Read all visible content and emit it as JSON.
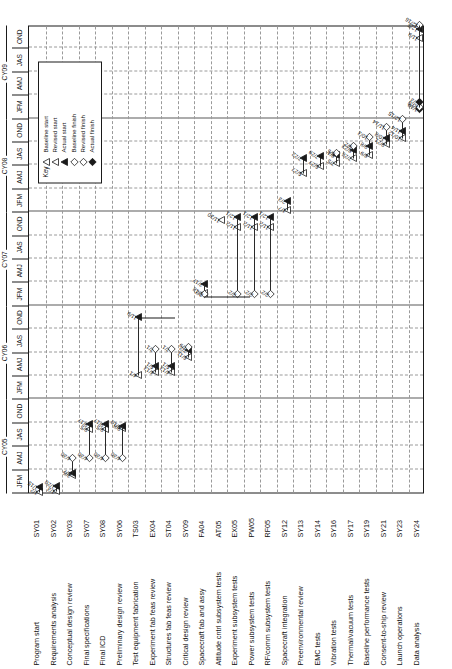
{
  "chart_data": {
    "type": "gantt",
    "orientation": "rotated-90",
    "fiscal_years": [
      "FY05",
      "FY06",
      "FY07",
      "FY08",
      "FY09",
      "FY10"
    ],
    "calendar_years": [
      "CY05",
      "CY06",
      "CY07",
      "CY08",
      "CY09"
    ],
    "quarters": [
      "JFM",
      "AMJ",
      "JAS",
      "OND"
    ],
    "quarter_sequence": [
      "JFM",
      "AMJ",
      "JAS",
      "OND",
      "JFM",
      "AMJ",
      "JAS",
      "OND",
      "JFM",
      "AMJ",
      "JAS",
      "OND",
      "JFM",
      "AMJ",
      "JAS",
      "OND",
      "JFM",
      "AMJ",
      "JAS",
      "OND"
    ],
    "xlabel": "",
    "ylabel": "",
    "grid": true,
    "tasks": [
      {
        "name": "Program start",
        "code": "SY01",
        "labels": [
          "1/2",
          "1/15"
        ]
      },
      {
        "name": "Requirements analysis",
        "code": "SY02",
        "labels": [
          "1/3",
          "1/20"
        ]
      },
      {
        "name": "Conceptual design review",
        "code": "SY03",
        "labels": [
          "3/6",
          "3/7",
          "4/30"
        ]
      },
      {
        "name": "Final specifications",
        "code": "SY07",
        "labels": [
          "9/5",
          "9/17",
          "4/30"
        ]
      },
      {
        "name": "Final ICD",
        "code": "SY08",
        "labels": [
          "9/5",
          "9/17",
          "4/30"
        ]
      },
      {
        "name": "Preliminary design review",
        "code": "SY06",
        "labels": [
          "9/8",
          "9/10",
          "4/30"
        ]
      },
      {
        "name": "Test equipment fabrication",
        "code": "TS03",
        "labels": [
          "4/1",
          "11/9"
        ]
      },
      {
        "name": "Experiment fab feas review",
        "code": "EX04",
        "labels": [
          "4/13",
          "5/1",
          "7/1"
        ]
      },
      {
        "name": "Structures fab feas review",
        "code": "ST04",
        "labels": [
          "4/13",
          "5/1",
          "7/1"
        ]
      },
      {
        "name": "Critical design review",
        "code": "SY09",
        "labels": [
          "6/11",
          "7/2",
          "7/9"
        ]
      },
      {
        "name": "Spacecraft fab and assy",
        "code": "FA04",
        "labels": [
          "2/18",
          "3/17",
          "2/2"
        ]
      },
      {
        "name": "Attitude cntrl subsystem tests",
        "code": "AT05",
        "labels": [
          "11/30"
        ]
      },
      {
        "name": "Experiment subsystem tests",
        "code": "EX05",
        "labels": [
          "11/2",
          "12/1",
          "2/2"
        ]
      },
      {
        "name": "Power subsystem tests",
        "code": "PW05",
        "labels": [
          "11/2",
          "12/1",
          "2/2"
        ]
      },
      {
        "name": "RF/comm subsystem tests",
        "code": "RF05",
        "labels": [
          "11/2",
          "12/1",
          "2/2"
        ]
      },
      {
        "name": "Spacecraft integration",
        "code": "SY12",
        "labels": [
          "1/7",
          "2/3"
        ]
      },
      {
        "name": "Preenvironmental review",
        "code": "SY13",
        "labels": [
          "5/27",
          "7/22"
        ]
      },
      {
        "name": "EMC tests",
        "code": "SY14",
        "labels": [
          "6/27",
          "7/29"
        ]
      },
      {
        "name": "Vibration tests",
        "code": "SY16",
        "labels": [
          "7/5",
          "8/1",
          "8/5"
        ]
      },
      {
        "name": "Thermal/vacuum tests",
        "code": "SY17",
        "labels": [
          "7/26",
          "8/23",
          "9/2"
        ]
      },
      {
        "name": "Baseline performance tests",
        "code": "SY19",
        "labels": [
          "8/9",
          "9/8",
          "10/3"
        ]
      },
      {
        "name": "Consent-to-ship review",
        "code": "SY21",
        "labels": [
          "9/21",
          "10/8",
          "11/14"
        ]
      },
      {
        "name": "Launch operations",
        "code": "SY23",
        "labels": [
          "10/12",
          "11/4",
          "12/15"
        ]
      },
      {
        "name": "Data analysis",
        "code": "SY24",
        "labels": [
          "11/9",
          "12/5",
          "12/16",
          "1/19",
          "1/20",
          "2/3"
        ]
      }
    ]
  },
  "key": {
    "title": "Key",
    "items": [
      {
        "label": "Baseline start",
        "glyph": "open-triangle-up"
      },
      {
        "label": "Revised start",
        "glyph": "double-open-triangle"
      },
      {
        "label": "Actual start",
        "glyph": "filled-triangle"
      },
      {
        "label": "Baseline finish",
        "glyph": "open-diamond"
      },
      {
        "label": "Revised finish",
        "glyph": "double-open-diamond"
      },
      {
        "label": "Actual finish",
        "glyph": "filled-diamond"
      }
    ]
  },
  "colors": {
    "frame": "#1a1a1a",
    "grid": "#9a9a9a",
    "marker": "#1a1a1a",
    "background": "#ffffff"
  }
}
